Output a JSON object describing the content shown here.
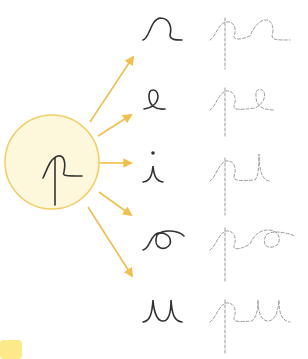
{
  "worksheet": {
    "center_letter": "p",
    "colors": {
      "circle_fill": "#fdf8dc",
      "circle_stroke": "#f3cf62",
      "arrow": "#f2c04a",
      "letter": "#333333",
      "trace": "#9a9a9a",
      "corner_patch": "#fbe98a"
    },
    "rows": [
      {
        "vowel": "a",
        "syllable": "pa"
      },
      {
        "vowel": "e",
        "syllable": "pe"
      },
      {
        "vowel": "i",
        "syllable": "pi"
      },
      {
        "vowel": "o",
        "syllable": "po"
      },
      {
        "vowel": "u",
        "syllable": "pu"
      }
    ]
  }
}
